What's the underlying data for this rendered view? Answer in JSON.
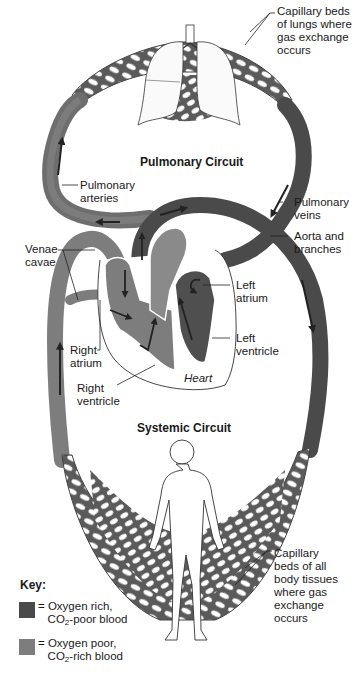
{
  "diagram": {
    "circuits": {
      "pulmonary": "Pulmonary Circuit",
      "systemic": "Systemic Circuit"
    },
    "labels": {
      "lung_capillaries": "Capillary beds\nof lungs where\ngas exchange\noccurs",
      "pulmonary_arteries": "Pulmonary\narteries",
      "pulmonary_veins": "Pulmonary\nveins",
      "aorta": "Aorta and\nbranches",
      "venae_cavae": "Venae\ncavae",
      "left_atrium": "Left\natrium",
      "left_ventricle": "Left\nventricle",
      "right_atrium": "Right\natrium",
      "right_ventricle": "Right\nventricle",
      "heart": "Heart",
      "body_capillaries": "Capillary\nbeds of all\nbody tissues\nwhere gas\nexchange\noccurs"
    },
    "key": {
      "title": "Key:",
      "items": [
        {
          "eq": "= ",
          "line1": "Oxygen rich,",
          "line2_pre": "CO",
          "line2_sub": "2",
          "line2_post": "-poor blood",
          "color": "#4a4a4a"
        },
        {
          "eq": "= ",
          "line1": "Oxygen poor,",
          "line2_pre": "CO",
          "line2_sub": "2",
          "line2_post": "-rich blood",
          "color": "#7d7d7d"
        }
      ]
    },
    "colors": {
      "oxygen_rich": "#4a4a4a",
      "oxygen_poor": "#7d7d7d",
      "arrow": "#222222",
      "outline": "#333333"
    }
  }
}
